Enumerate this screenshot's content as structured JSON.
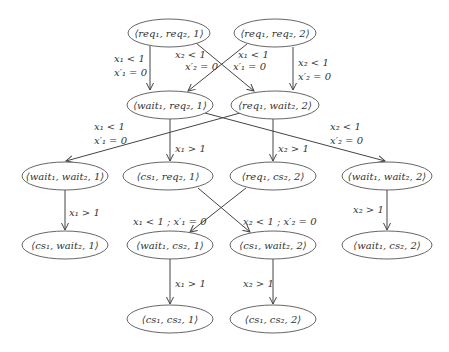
{
  "diagram": {
    "title": "",
    "nodes": [
      {
        "id": "n1",
        "label": "⟨req₁, req₂, 1⟩",
        "cx": 169,
        "cy": 33,
        "rx": 41,
        "ry": 14
      },
      {
        "id": "n2",
        "label": "⟨req₁, req₂, 2⟩",
        "cx": 275,
        "cy": 33,
        "rx": 41,
        "ry": 14
      },
      {
        "id": "n3",
        "label": "⟨wait₁, req₂, 1⟩",
        "cx": 170,
        "cy": 105,
        "rx": 43,
        "ry": 14
      },
      {
        "id": "n4",
        "label": "⟨req₁, wait₂, 2⟩",
        "cx": 275,
        "cy": 105,
        "rx": 44,
        "ry": 14
      },
      {
        "id": "n5",
        "label": "⟨wait₁, wait₂, 1⟩",
        "cx": 65,
        "cy": 176,
        "rx": 43,
        "ry": 14
      },
      {
        "id": "n6",
        "label": "⟨cs₁, req₂, 1⟩",
        "cx": 168,
        "cy": 176,
        "rx": 45,
        "ry": 14
      },
      {
        "id": "n7",
        "label": "⟨req₁, cs₂, 2⟩",
        "cx": 273,
        "cy": 176,
        "rx": 43,
        "ry": 14
      },
      {
        "id": "n8",
        "label": "⟨wait₁, wait₂, 2⟩",
        "cx": 387,
        "cy": 176,
        "rx": 45,
        "ry": 14
      },
      {
        "id": "n9",
        "label": "⟨cs₁, wait₂, 1⟩",
        "cx": 65,
        "cy": 245,
        "rx": 43,
        "ry": 14
      },
      {
        "id": "n10",
        "label": "⟨wait₁, cs₂, 1⟩",
        "cx": 170,
        "cy": 245,
        "rx": 43,
        "ry": 14
      },
      {
        "id": "n11",
        "label": "⟨cs₁, wait₂, 2⟩",
        "cx": 273,
        "cy": 245,
        "rx": 43,
        "ry": 14
      },
      {
        "id": "n12",
        "label": "⟨wait₁, cs₂, 2⟩",
        "cx": 387,
        "cy": 245,
        "rx": 45,
        "ry": 14
      },
      {
        "id": "n13",
        "label": "⟨cs₁, cs₂, 1⟩",
        "cx": 170,
        "cy": 319,
        "rx": 43,
        "ry": 14
      },
      {
        "id": "n14",
        "label": "⟨cs₁, cs₂, 2⟩",
        "cx": 273,
        "cy": 319,
        "rx": 43,
        "ry": 14
      }
    ],
    "edges": [
      {
        "from": "n1",
        "to": "n3",
        "label_lines": [
          "x₁ < 1",
          "x′₁ = 0"
        ]
      },
      {
        "from": "n1",
        "to": "n4",
        "label_lines": [
          "x₂ < 1",
          "x′₂ = 0"
        ]
      },
      {
        "from": "n2",
        "to": "n3",
        "label_lines": [
          "x₁ < 1",
          "x′₁ = 0"
        ]
      },
      {
        "from": "n2",
        "to": "n4",
        "label_lines": [
          "x₂ < 1",
          "x′₂ = 0"
        ]
      },
      {
        "from": "n3",
        "to": "n6",
        "label_lines": [
          "x₁ > 1"
        ]
      },
      {
        "from": "n3",
        "to": "n8",
        "label_lines": [
          "x₂ < 1",
          "x′₂ = 0"
        ]
      },
      {
        "from": "n4",
        "to": "n5",
        "label_lines": [
          "x₁ < 1",
          "x′₁ = 0"
        ]
      },
      {
        "from": "n4",
        "to": "n7",
        "label_lines": [
          "x₂ > 1"
        ]
      },
      {
        "from": "n5",
        "to": "n9",
        "label_lines": [
          "x₁ > 1"
        ]
      },
      {
        "from": "n6",
        "to": "n11",
        "label_lines": [
          "x₂ < 1 ; x′₂ = 0"
        ]
      },
      {
        "from": "n7",
        "to": "n10",
        "label_lines": [
          "x₁ < 1 ; x′₁ = 0"
        ]
      },
      {
        "from": "n8",
        "to": "n12",
        "label_lines": [
          "x₂ > 1"
        ]
      },
      {
        "from": "n10",
        "to": "n13",
        "label_lines": [
          "x₁ > 1"
        ]
      },
      {
        "from": "n11",
        "to": "n14",
        "label_lines": [
          "x₂ > 1"
        ]
      }
    ],
    "edge_labels": {
      "e1": {
        "l1": "x₁ < 1",
        "l2": "x′₁ = 0"
      },
      "e2": {
        "l1": "x₂ < 1",
        "l2": "x′₂ = 0"
      },
      "e3": {
        "l1": "x₁ < 1",
        "l2": "x′₁ = 0"
      },
      "e4": {
        "l1": "x₂ < 1",
        "l2": "x′₂ = 0"
      },
      "e5": {
        "l1": "x₁ > 1"
      },
      "e6": {
        "l1": "x₂ < 1",
        "l2": "x′₂ = 0"
      },
      "e7": {
        "l1": "x₁ < 1",
        "l2": "x′₁ = 0"
      },
      "e8": {
        "l1": "x₂ > 1"
      },
      "e9": {
        "l1": "x₁ > 1"
      },
      "e10": {
        "l1": "x₂ < 1 ; x′₂ = 0"
      },
      "e11": {
        "l1": "x₁ < 1 ; x′₁ = 0"
      },
      "e12": {
        "l1": "x₂ > 1"
      },
      "e13": {
        "l1": "x₁ > 1"
      },
      "e14": {
        "l1": "x₂ > 1"
      }
    },
    "colors": {
      "stroke": "#444444",
      "text": "#333333",
      "background": "#ffffff"
    }
  }
}
